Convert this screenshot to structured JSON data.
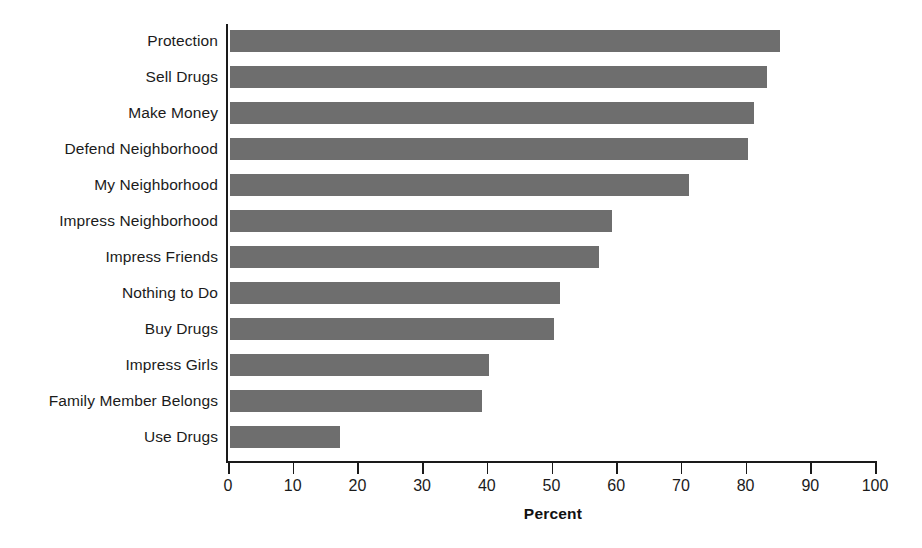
{
  "chart_data": {
    "type": "bar",
    "orientation": "horizontal",
    "title": "",
    "subtitle": "",
    "xlabel": "Percent",
    "ylabel": "",
    "xlim": [
      0,
      100
    ],
    "xticks": [
      0,
      10,
      20,
      30,
      40,
      50,
      60,
      70,
      80,
      90,
      100
    ],
    "xtick_labels": [
      "0",
      "10",
      "20",
      "30",
      "40",
      "50",
      "60",
      "70",
      "80",
      "90",
      "100"
    ],
    "grid": false,
    "legend": false,
    "legend_position": "none",
    "bar_color": "#6e6e6e",
    "axis_color": "#1a1a1a",
    "background_color": "#ffffff",
    "categories": [
      "Protection",
      "Sell Drugs",
      "Make Money",
      "Defend Neighborhood",
      "My Neighborhood",
      "Impress Neighborhood",
      "Impress Friends",
      "Nothing to Do",
      "Buy Drugs",
      "Impress Girls",
      "Family Member Belongs",
      "Use Drugs"
    ],
    "values": [
      85,
      83,
      81,
      80,
      71,
      59,
      57,
      51,
      50,
      40,
      39,
      17
    ],
    "series": [
      {
        "name": "Percent",
        "values": [
          85,
          83,
          81,
          80,
          71,
          59,
          57,
          51,
          50,
          40,
          39,
          17
        ]
      }
    ]
  }
}
